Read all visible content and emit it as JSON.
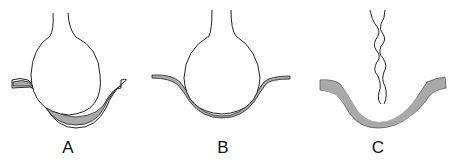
{
  "figure": {
    "panels": [
      {
        "id": "A",
        "label": "A",
        "description": "Bulb resting on thick gray layer with outer white border"
      },
      {
        "id": "B",
        "label": "B",
        "description": "Bulb resting on thin gray layer"
      },
      {
        "id": "C",
        "label": "C",
        "description": "Thick gray layer with wavy strand above, no bulb"
      }
    ],
    "colors": {
      "fill": "#a9a9a9",
      "stroke": "#222222",
      "background": "#ffffff"
    }
  }
}
